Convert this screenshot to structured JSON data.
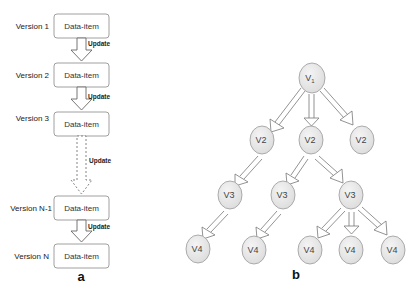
{
  "panel_a": {
    "label": "a",
    "versions": [
      {
        "label": "Version 1",
        "item": "Data-item"
      },
      {
        "label": "Version 2",
        "item": "Data-item"
      },
      {
        "label": "Version 3",
        "item": "Data-item"
      },
      {
        "label": "Version N-1",
        "item": "Data-item"
      },
      {
        "label": "Version N",
        "item": "Data-item"
      }
    ],
    "arrows": [
      {
        "label": "Update",
        "style": "solid"
      },
      {
        "label": "Update",
        "style": "solid"
      },
      {
        "label": "Update",
        "style": "dashed"
      },
      {
        "label": "Update",
        "style": "solid"
      }
    ]
  },
  "panel_b": {
    "label": "b",
    "nodes": {
      "root": {
        "base": "V",
        "sub": "1"
      },
      "v2": [
        {
          "base": "V",
          "sub": "2"
        },
        {
          "base": "V",
          "sub": "2"
        },
        {
          "base": "V",
          "sub": "2"
        }
      ],
      "v3": [
        {
          "base": "V",
          "sub": "3"
        },
        {
          "base": "V",
          "sub": "3"
        },
        {
          "base": "V",
          "sub": "3"
        }
      ],
      "v4": [
        {
          "base": "V",
          "sub": "4"
        },
        {
          "base": "V",
          "sub": "4"
        },
        {
          "base": "V",
          "sub": "4"
        },
        {
          "base": "V",
          "sub": "4"
        },
        {
          "base": "V",
          "sub": "4"
        }
      ]
    }
  }
}
